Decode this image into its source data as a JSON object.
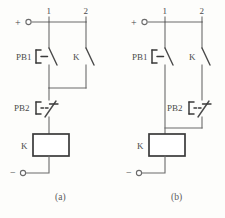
{
  "figure": {
    "caption_a": "(a)",
    "caption_b": "(b)",
    "watermark_text": ""
  },
  "circuit_a": {
    "polarity_positive": "+",
    "polarity_negative": "−",
    "node_label_1": "1",
    "node_label_2": "2",
    "pushbutton_start": {
      "label": "PB1",
      "type": "normally-open-pushbutton"
    },
    "relay_contact": {
      "label": "K",
      "type": "normally-open-contact"
    },
    "pushbutton_stop": {
      "label": "PB2",
      "type": "normally-closed-pushbutton"
    },
    "relay_coil": {
      "label": "K",
      "type": "coil"
    }
  },
  "circuit_b": {
    "polarity_positive": "+",
    "polarity_negative": "−",
    "node_label_1": "1",
    "node_label_2": "2",
    "pushbutton_start": {
      "label": "PB1",
      "type": "normally-open-pushbutton"
    },
    "relay_contact": {
      "label": "K",
      "type": "normally-open-contact"
    },
    "pushbutton_stop": {
      "label": "PB2",
      "type": "normally-closed-pushbutton"
    },
    "relay_coil": {
      "label": "K",
      "type": "coil"
    }
  },
  "colors": {
    "wire": "#6b6b6b",
    "symbol": "#3a3a3a",
    "text": "#4a4a4a",
    "background": "#fdfdfb"
  }
}
